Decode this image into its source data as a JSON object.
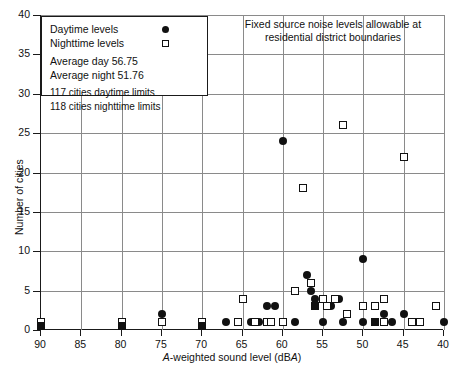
{
  "chart_data": {
    "type": "scatter",
    "title": "Fixed source noise levels allowable at residential district boundaries",
    "xlabel": "A-weighted sound level (dBA)",
    "ylabel": "Number of cities",
    "xlim": [
      90,
      40
    ],
    "ylim": [
      0,
      40
    ],
    "x_reversed": true,
    "xticks": [
      90,
      85,
      80,
      75,
      70,
      65,
      60,
      55,
      50,
      45,
      40
    ],
    "yticks": [
      0,
      5,
      10,
      15,
      20,
      25,
      30,
      35,
      40
    ],
    "grid": true,
    "legend_position": "top-left",
    "series": [
      {
        "name": "Daytime levels",
        "marker": "filled-circle",
        "color": "#111111",
        "points": [
          {
            "x": 90,
            "y": 1
          },
          {
            "x": 80,
            "y": 1
          },
          {
            "x": 75,
            "y": 2
          },
          {
            "x": 70,
            "y": 1
          },
          {
            "x": 67,
            "y": 1
          },
          {
            "x": 65,
            "y": 4
          },
          {
            "x": 64,
            "y": 1
          },
          {
            "x": 63,
            "y": 1
          },
          {
            "x": 62,
            "y": 3
          },
          {
            "x": 61,
            "y": 3
          },
          {
            "x": 60,
            "y": 24
          },
          {
            "x": 60,
            "y": 1
          },
          {
            "x": 58.5,
            "y": 1
          },
          {
            "x": 57,
            "y": 7
          },
          {
            "x": 56.5,
            "y": 5
          },
          {
            "x": 56,
            "y": 4
          },
          {
            "x": 55,
            "y": 4
          },
          {
            "x": 55,
            "y": 1
          },
          {
            "x": 54,
            "y": 3
          },
          {
            "x": 53,
            "y": 4
          },
          {
            "x": 52.5,
            "y": 1
          },
          {
            "x": 50,
            "y": 9
          },
          {
            "x": 50,
            "y": 1
          },
          {
            "x": 48.5,
            "y": 1
          },
          {
            "x": 47.5,
            "y": 2
          },
          {
            "x": 46.5,
            "y": 1
          },
          {
            "x": 45,
            "y": 2
          },
          {
            "x": 40,
            "y": 1
          }
        ]
      },
      {
        "name": "Nighttime levels",
        "marker": "open-square",
        "color": "#ffffff",
        "points": [
          {
            "x": 90,
            "y": 1
          },
          {
            "x": 80,
            "y": 1
          },
          {
            "x": 75,
            "y": 1
          },
          {
            "x": 70,
            "y": 1
          },
          {
            "x": 65.5,
            "y": 1
          },
          {
            "x": 65,
            "y": 4
          },
          {
            "x": 63.5,
            "y": 1
          },
          {
            "x": 62,
            "y": 1
          },
          {
            "x": 61.5,
            "y": 1
          },
          {
            "x": 60,
            "y": 1
          },
          {
            "x": 58.5,
            "y": 5
          },
          {
            "x": 57.5,
            "y": 18
          },
          {
            "x": 56.5,
            "y": 6
          },
          {
            "x": 56,
            "y": 3
          },
          {
            "x": 55,
            "y": 4
          },
          {
            "x": 54.5,
            "y": 3
          },
          {
            "x": 53.5,
            "y": 4
          },
          {
            "x": 52.5,
            "y": 26
          },
          {
            "x": 52,
            "y": 2
          },
          {
            "x": 50,
            "y": 3
          },
          {
            "x": 48.5,
            "y": 3
          },
          {
            "x": 47.5,
            "y": 4
          },
          {
            "x": 47.5,
            "y": 1
          },
          {
            "x": 45,
            "y": 22
          },
          {
            "x": 44,
            "y": 1
          },
          {
            "x": 43,
            "y": 1
          },
          {
            "x": 41,
            "y": 3
          }
        ]
      },
      {
        "name": "Overlapping daytime and nighttime",
        "marker": "filled-square",
        "color": "#111111",
        "points": [
          {
            "x": 90,
            "y": 0.5
          },
          {
            "x": 80,
            "y": 0.5
          },
          {
            "x": 70,
            "y": 0.5
          },
          {
            "x": 56,
            "y": 3
          },
          {
            "x": 48.5,
            "y": 1
          }
        ]
      }
    ]
  },
  "legend": {
    "items": [
      {
        "label": "Daytime levels",
        "marker": "filled-circle"
      },
      {
        "label": "Nighttime levels",
        "marker": "open-square"
      }
    ],
    "avg_day": "Average day 56.75",
    "avg_night": "Average night 51.76",
    "count_day": "117 cities daytime limits",
    "count_night": "118 cities nighttime limits"
  },
  "annotation": {
    "line1": "Fixed source noise levels allowable at",
    "line2": "residential district boundaries"
  },
  "axes": {
    "x_title_pre": "A",
    "x_title_mid": "-weighted sound level (dB",
    "x_title_a": "A",
    "x_title_post": ")",
    "y_title": "Number of cities"
  }
}
